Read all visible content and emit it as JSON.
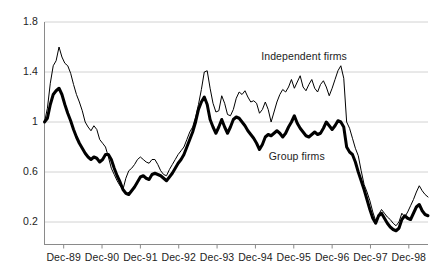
{
  "chart_data": {
    "type": "line",
    "title": "",
    "subtitle": "",
    "xlabel": "",
    "ylabel": "",
    "ylim": [
      0,
      1.8
    ],
    "yticks": [
      "0.2",
      "0.6",
      "1",
      "1.4",
      "1.8"
    ],
    "ytick_values": [
      0.2,
      0.6,
      1.0,
      1.4,
      1.8
    ],
    "grid": "horizontal",
    "legend_position": "inline-annotations",
    "x_axis_type": "monthly",
    "x_start": "Dec-89",
    "x_end": "Dec-98",
    "xticks": [
      "Dec-89",
      "Dec-90",
      "Dec-91",
      "Dec-92",
      "Dec-93",
      "Dec-94",
      "Dec-95",
      "Dec-96",
      "Dec-97",
      "Dec-98"
    ],
    "annotations": [
      {
        "text": "Independent firms",
        "x_frac": 0.565,
        "y_value": 1.53
      },
      {
        "text": "Group firms",
        "x_frac": 0.585,
        "y_value": 0.73
      }
    ],
    "series": [
      {
        "name": "Independent firms",
        "style": "thin",
        "color": "#000000",
        "width": 1,
        "values": [
          1.0,
          1.11,
          1.31,
          1.45,
          1.49,
          1.6,
          1.52,
          1.47,
          1.45,
          1.39,
          1.3,
          1.22,
          1.16,
          1.09,
          1.0,
          0.96,
          0.93,
          0.97,
          0.94,
          0.86,
          0.83,
          0.8,
          0.72,
          0.63,
          0.58,
          0.53,
          0.49,
          0.46,
          0.55,
          0.61,
          0.63,
          0.66,
          0.7,
          0.72,
          0.7,
          0.68,
          0.67,
          0.7,
          0.7,
          0.66,
          0.61,
          0.58,
          0.57,
          0.62,
          0.66,
          0.7,
          0.74,
          0.77,
          0.8,
          0.86,
          0.92,
          0.96,
          1.04,
          1.14,
          1.26,
          1.4,
          1.41,
          1.27,
          1.15,
          1.08,
          1.09,
          1.21,
          1.15,
          1.06,
          1.05,
          1.1,
          1.19,
          1.24,
          1.22,
          1.25,
          1.2,
          1.16,
          1.17,
          1.15,
          1.07,
          1.1,
          1.16,
          1.1,
          1.0,
          1.08,
          1.16,
          1.22,
          1.26,
          1.24,
          1.28,
          1.34,
          1.27,
          1.32,
          1.37,
          1.28,
          1.25,
          1.3,
          1.34,
          1.27,
          1.24,
          1.3,
          1.33,
          1.28,
          1.21,
          1.27,
          1.34,
          1.41,
          1.45,
          1.35,
          1.0,
          0.95,
          0.87,
          0.79,
          0.73,
          0.61,
          0.5,
          0.44,
          0.37,
          0.28,
          0.21,
          0.26,
          0.3,
          0.27,
          0.24,
          0.22,
          0.19,
          0.17,
          0.2,
          0.27,
          0.24,
          0.28,
          0.33,
          0.38,
          0.44,
          0.49,
          0.45,
          0.42,
          0.4
        ]
      },
      {
        "name": "Group firms",
        "style": "thick",
        "color": "#000000",
        "width": 3,
        "values": [
          1.0,
          1.03,
          1.14,
          1.22,
          1.25,
          1.27,
          1.22,
          1.14,
          1.07,
          1.01,
          0.94,
          0.88,
          0.83,
          0.79,
          0.75,
          0.72,
          0.7,
          0.72,
          0.71,
          0.68,
          0.7,
          0.74,
          0.74,
          0.7,
          0.63,
          0.57,
          0.52,
          0.46,
          0.43,
          0.42,
          0.45,
          0.48,
          0.52,
          0.56,
          0.57,
          0.55,
          0.54,
          0.58,
          0.59,
          0.58,
          0.57,
          0.55,
          0.53,
          0.56,
          0.59,
          0.63,
          0.67,
          0.7,
          0.74,
          0.8,
          0.86,
          0.92,
          1.0,
          1.1,
          1.16,
          1.2,
          1.14,
          1.02,
          0.96,
          0.91,
          0.96,
          1.02,
          0.96,
          0.91,
          0.96,
          1.02,
          1.04,
          1.03,
          1.0,
          0.97,
          0.93,
          0.9,
          0.87,
          0.83,
          0.78,
          0.82,
          0.88,
          0.9,
          0.89,
          0.91,
          0.93,
          0.91,
          0.88,
          0.91,
          0.96,
          1.0,
          1.05,
          0.99,
          0.95,
          0.92,
          0.89,
          0.88,
          0.9,
          0.92,
          0.9,
          0.91,
          0.95,
          1.0,
          0.97,
          0.94,
          0.97,
          1.01,
          1.0,
          0.96,
          0.8,
          0.76,
          0.74,
          0.68,
          0.6,
          0.53,
          0.46,
          0.38,
          0.3,
          0.23,
          0.19,
          0.25,
          0.27,
          0.23,
          0.19,
          0.16,
          0.14,
          0.13,
          0.15,
          0.22,
          0.25,
          0.23,
          0.22,
          0.27,
          0.32,
          0.34,
          0.29,
          0.26,
          0.25
        ]
      }
    ]
  }
}
